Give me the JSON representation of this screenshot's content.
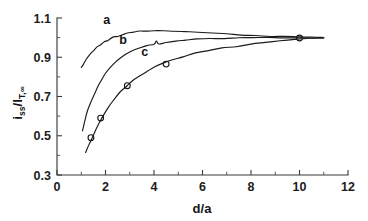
{
  "chart_data": {
    "type": "line",
    "title": "",
    "xlabel": "d/a",
    "ylabel": "i_ss/I_T,∞",
    "ylabel_parts": {
      "main1": "i",
      "sub1": "ss",
      "slash": "/I",
      "sub2": "T,∞"
    },
    "xlim": [
      0,
      12
    ],
    "ylim": [
      0.3,
      1.1
    ],
    "x_ticks": [
      0,
      2,
      4,
      6,
      8,
      10,
      12
    ],
    "x_tick_labels": [
      "0",
      "2",
      "4",
      "6",
      "8",
      "10",
      "12"
    ],
    "x_minor_step": 1,
    "y_ticks": [
      0.3,
      0.5,
      0.7,
      0.9,
      1.1
    ],
    "y_tick_labels": [
      "0.3",
      "0.5",
      "0.7",
      "0.9",
      "1.1"
    ],
    "y_minor_step": 0.1,
    "grid": false,
    "legend": "inline-curve-labels",
    "annotations": [
      {
        "text": "a",
        "x": 2.05,
        "y": 1.068
      },
      {
        "text": "b",
        "x": 2.72,
        "y": 0.968
      },
      {
        "text": "c",
        "x": 3.62,
        "y": 0.905
      }
    ],
    "series": [
      {
        "name": "a",
        "label": "a",
        "marker": "none",
        "x": [
          1.0,
          1.1,
          1.2,
          1.35,
          1.5,
          1.65,
          1.8,
          1.95,
          2.1,
          2.3,
          2.5,
          2.7,
          2.9,
          3.15,
          3.4,
          3.7,
          4.0,
          4.4,
          4.8,
          5.3,
          5.8,
          6.4,
          7.0,
          7.6,
          8.2,
          8.8,
          9.4,
          10.0,
          10.5,
          11.0
        ],
        "y": [
          0.845,
          0.868,
          0.888,
          0.912,
          0.934,
          0.952,
          0.966,
          0.978,
          0.988,
          1.0,
          1.008,
          1.016,
          1.022,
          1.027,
          1.031,
          1.034,
          1.035,
          1.035,
          1.033,
          1.03,
          1.026,
          1.022,
          1.018,
          1.014,
          1.011,
          1.008,
          1.005,
          1.002,
          1.001,
          1.0
        ]
      },
      {
        "name": "b",
        "label": "b",
        "marker": "none",
        "x": [
          1.05,
          1.15,
          1.25,
          1.4,
          1.55,
          1.7,
          1.85,
          2.0,
          2.2,
          2.4,
          2.6,
          2.85,
          3.1,
          3.4,
          3.7,
          4.0,
          4.1,
          4.2,
          4.5,
          4.9,
          5.3,
          5.8,
          6.3,
          6.9,
          7.5,
          8.1,
          8.7,
          9.3,
          10.0,
          10.6,
          11.0
        ],
        "y": [
          0.525,
          0.578,
          0.622,
          0.672,
          0.716,
          0.754,
          0.788,
          0.816,
          0.848,
          0.874,
          0.896,
          0.916,
          0.932,
          0.948,
          0.96,
          0.968,
          0.982,
          0.97,
          0.976,
          0.982,
          0.987,
          0.991,
          0.994,
          0.996,
          0.998,
          0.999,
          1.0,
          1.0,
          1.0,
          1.0,
          1.0
        ]
      },
      {
        "name": "c",
        "label": "c",
        "marker": "circle",
        "x": [
          1.18,
          1.3,
          1.45,
          1.6,
          1.78,
          1.95,
          2.15,
          2.35,
          2.6,
          2.85,
          3.1,
          3.4,
          3.7,
          4.05,
          4.4,
          4.8,
          5.2,
          5.7,
          6.2,
          6.8,
          7.4,
          8.0,
          8.6,
          9.2,
          9.8,
          10.4,
          11.0
        ],
        "y": [
          0.412,
          0.448,
          0.49,
          0.53,
          0.572,
          0.61,
          0.65,
          0.686,
          0.722,
          0.752,
          0.779,
          0.806,
          0.829,
          0.852,
          0.871,
          0.889,
          0.904,
          0.92,
          0.933,
          0.945,
          0.956,
          0.965,
          0.974,
          0.982,
          0.989,
          0.995,
          1.0
        ]
      }
    ],
    "data_points": [
      {
        "x": 1.4,
        "y": 0.49,
        "series": "c"
      },
      {
        "x": 1.8,
        "y": 0.59,
        "series": "c"
      },
      {
        "x": 2.9,
        "y": 0.755,
        "series": "c"
      },
      {
        "x": 4.5,
        "y": 0.865,
        "series": "c"
      },
      {
        "x": 10.0,
        "y": 0.998,
        "series": "c"
      }
    ]
  },
  "colors": {
    "background": "#ffffff",
    "ink": "#1a1a1a",
    "axis": "#3b3b3b"
  }
}
